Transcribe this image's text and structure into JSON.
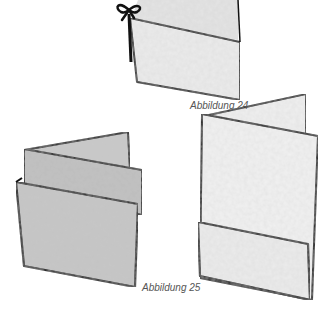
{
  "figures": [
    {
      "id": "fig24",
      "caption": "Abbildung 24"
    },
    {
      "id": "fig25",
      "caption": "Abbildung 25"
    }
  ],
  "colors": {
    "outline": "#111111",
    "paper_light": "#ececec",
    "paper_dark": "#bdbdbd",
    "caption": "#555555"
  }
}
